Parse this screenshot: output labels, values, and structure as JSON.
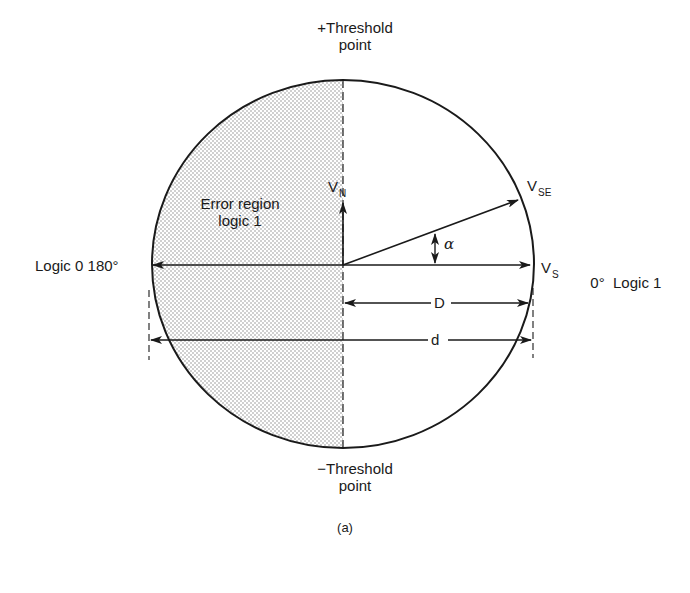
{
  "figure": {
    "caption": "(a)",
    "top_label": {
      "line1": "+Threshold",
      "line2": "point"
    },
    "bottom_label": {
      "line1": "−Threshold",
      "line2": "point"
    },
    "left_label": "Logic 0 180°",
    "right_label": "0°  Logic 1",
    "error_region": {
      "line1": "Error region",
      "line2": "logic 1"
    },
    "vectors": {
      "noise": {
        "main": "V",
        "sub": "N"
      },
      "signal_plus_error": {
        "main": "V",
        "sub": "SE"
      },
      "signal": {
        "main": "V",
        "sub": "S"
      }
    },
    "angle_label": "α",
    "dimensions": {
      "D": "D",
      "d": "d"
    }
  },
  "colors": {
    "ink": "#1a1a1a",
    "shade": "#9a9a9a",
    "background": "#ffffff"
  }
}
